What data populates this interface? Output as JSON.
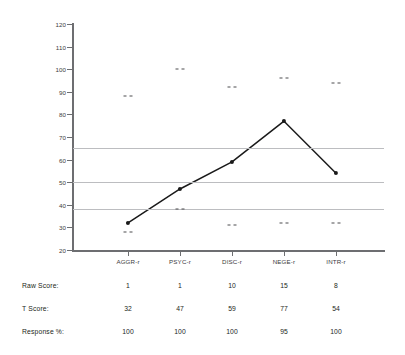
{
  "chart_data": {
    "type": "line",
    "title": "",
    "xlabel": "",
    "ylabel": "",
    "ylim": [
      20,
      120
    ],
    "ytick_step": 10,
    "yticks": [
      120,
      110,
      100,
      90,
      80,
      70,
      60,
      50,
      40,
      30,
      20
    ],
    "grid": false,
    "legend": "none",
    "categories": [
      "AGGR-r",
      "PSYC-r",
      "DISC-r",
      "NEGE-r",
      "INTR-r"
    ],
    "series": [
      {
        "name": "T Score",
        "values": [
          32,
          47,
          59,
          77,
          54
        ]
      }
    ],
    "reference_lines": [
      {
        "value": 65,
        "color": "#bcbdc0"
      },
      {
        "value": 50,
        "color": "#bcbdc0"
      },
      {
        "value": 38,
        "color": "#bcbdc0"
      }
    ],
    "confidence_ticks_upper": [
      88,
      100,
      92,
      96,
      94
    ],
    "confidence_ticks_lower": [
      28,
      38,
      31,
      32,
      32
    ],
    "line_color": "#1a1a1a",
    "marker_color": "#1a1a1a",
    "axis_color": "#6d6e71"
  },
  "table": {
    "row_labels": [
      "Raw Score:",
      "T Score:",
      "Response %:"
    ],
    "rows": [
      {
        "label": "Raw Score:",
        "values": [
          "1",
          "1",
          "10",
          "15",
          "8"
        ]
      },
      {
        "label": "T Score:",
        "values": [
          "32",
          "47",
          "59",
          "77",
          "54"
        ]
      },
      {
        "label": "Response %:",
        "values": [
          "100",
          "100",
          "100",
          "95",
          "100"
        ]
      }
    ]
  }
}
